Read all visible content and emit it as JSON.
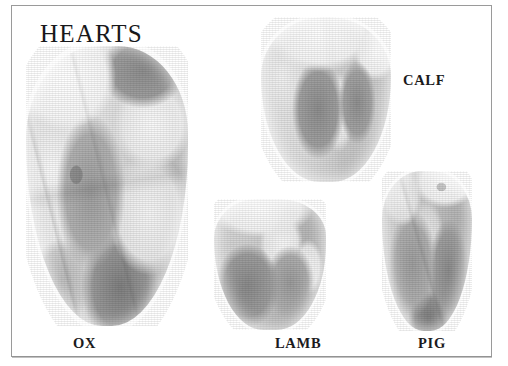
{
  "plate": {
    "title": "HEARTS",
    "background_color": "#ffffff",
    "frame_color": "#9a9a9a",
    "text_color": "#18181a",
    "image_type": "grayscale-photographic-plate"
  },
  "specimens": [
    {
      "label": "OX",
      "icon_name": "ox-heart-photo",
      "relative_size": "largest",
      "tone_notes": "pale fatty lobes upper-left, dark gray myocardium lower-centre"
    },
    {
      "label": "CALF",
      "icon_name": "calf-heart-photo",
      "relative_size": "medium-large",
      "tone_notes": "white fat cap across top, two mid-gray ventricle patches"
    },
    {
      "label": "LAMB",
      "icon_name": "lamb-heart-photo",
      "relative_size": "small",
      "tone_notes": "white fat at apex-top, mid-gray muscle across lower body"
    },
    {
      "label": "PIG",
      "icon_name": "pig-heart-photo",
      "relative_size": "small-medium",
      "tone_notes": "pale upper right, darker gray ventricles, rounded apex"
    }
  ]
}
